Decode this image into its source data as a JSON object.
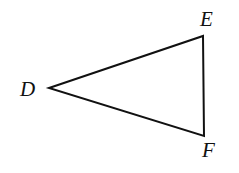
{
  "diagram": {
    "type": "triangle",
    "stroke_color": "#111111",
    "background": "#ffffff",
    "vertices": [
      {
        "name": "D",
        "x": 49,
        "y": 88,
        "label_x": 20,
        "label_y": 96
      },
      {
        "name": "E",
        "x": 203,
        "y": 36,
        "label_x": 200,
        "label_y": 26
      },
      {
        "name": "F",
        "x": 204,
        "y": 136,
        "label_x": 202,
        "label_y": 157
      }
    ],
    "edges": [
      [
        "D",
        "E"
      ],
      [
        "E",
        "F"
      ],
      [
        "F",
        "D"
      ]
    ]
  },
  "labels": {
    "D": "D",
    "E": "E",
    "F": "F"
  }
}
